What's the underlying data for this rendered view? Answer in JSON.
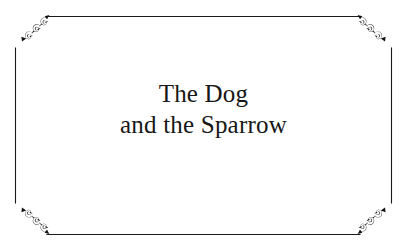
{
  "page": {
    "background_color": "#ffffff",
    "ink_color": "#171717"
  },
  "frame": {
    "name": "decorative-border",
    "style": "cut-corner rectangle with scrollwork corner ornaments",
    "line_color": "#1a1a1a",
    "ornament_color": "#111111",
    "ornament_motif": "spiral-scroll-chain"
  },
  "title": {
    "full_text": "The Dog and the Sparrow",
    "line1": "The Dog",
    "line2": "and the Sparrow"
  }
}
